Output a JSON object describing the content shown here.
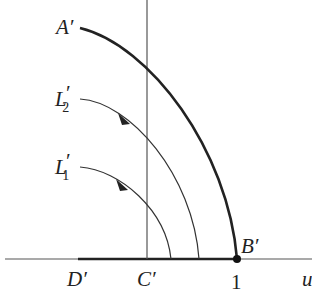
{
  "diagram": {
    "type": "conformal-map-plane",
    "axes": {
      "horizontal_label": "u",
      "tick_label_one": "1"
    },
    "points": {
      "A": "A′",
      "B": "B′",
      "C": "C′",
      "D": "D′"
    },
    "curves": {
      "L2": {
        "label": "L",
        "sub": "2",
        "prime": "′"
      },
      "L1": {
        "label": "L",
        "sub": "1",
        "prime": "′"
      }
    },
    "colors": {
      "ink": "#222222",
      "axis": "#555555"
    }
  }
}
